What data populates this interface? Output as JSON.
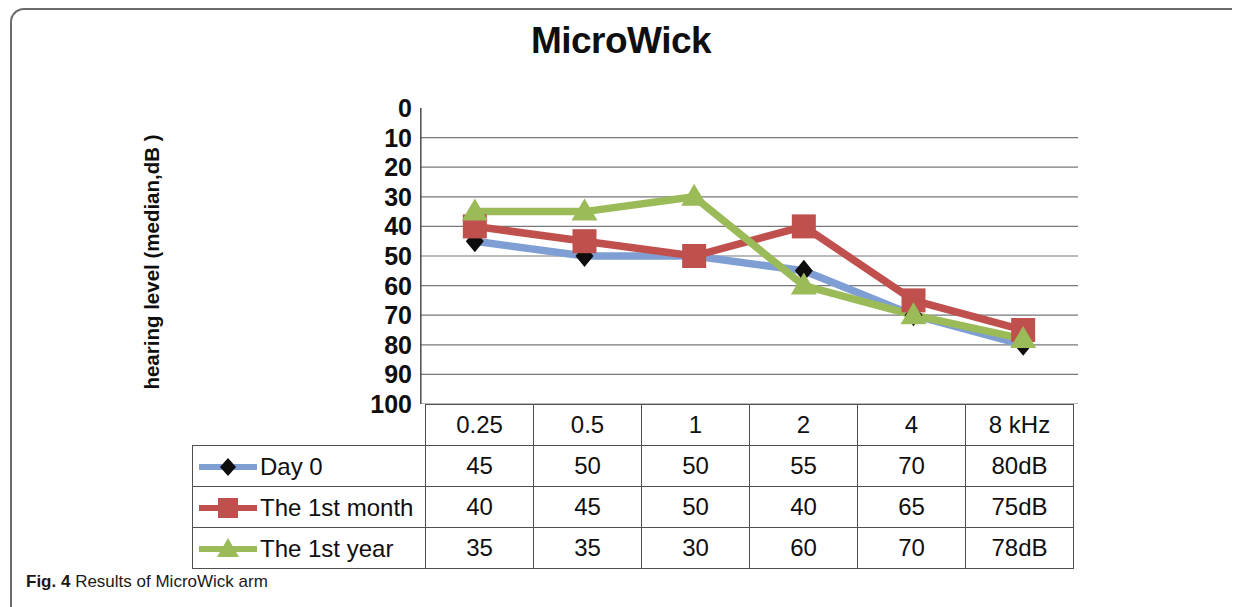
{
  "figure": {
    "caption_prefix": "Fig. 4",
    "caption_text": " Results of MicroWick arm"
  },
  "chart_data": {
    "type": "line",
    "title": "MicroWick",
    "xlabel": "",
    "ylabel": "hearing level (median,dB )",
    "categories": [
      "0.25",
      "0.5",
      "1",
      "2",
      "4",
      "8 kHz"
    ],
    "x_unit": "kHz",
    "ylim": [
      0,
      100
    ],
    "y_inverted": true,
    "y_ticks": [
      0,
      10,
      20,
      30,
      40,
      50,
      60,
      70,
      80,
      90,
      100
    ],
    "grid": true,
    "legend_position": "table-left",
    "series": [
      {
        "name": "Day 0",
        "values": [
          45,
          50,
          50,
          55,
          70,
          80
        ],
        "display_values": [
          "45",
          "50",
          "50",
          "55",
          "70",
          "80dB"
        ],
        "line_color": "#7f9fd4",
        "marker_color": "#0d0d0d",
        "marker": "diamond"
      },
      {
        "name": "The 1st month",
        "values": [
          40,
          45,
          50,
          40,
          65,
          75
        ],
        "display_values": [
          "40",
          "45",
          "50",
          "40",
          "65",
          "75dB"
        ],
        "line_color": "#c0504d",
        "marker_color": "#c0504d",
        "marker": "square"
      },
      {
        "name": "The 1st year",
        "values": [
          35,
          35,
          30,
          60,
          70,
          78
        ],
        "display_values": [
          "35",
          "35",
          "30",
          "60",
          "70",
          "78dB"
        ],
        "line_color": "#9bbb59",
        "marker_color": "#9bbb59",
        "marker": "triangle"
      }
    ]
  }
}
